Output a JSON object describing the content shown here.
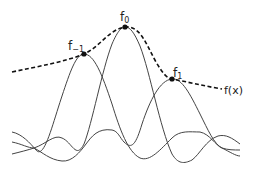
{
  "diagram": {
    "labels": {
      "f_minus1": {
        "base": "f",
        "sub": "−1"
      },
      "f_0": {
        "base": "f",
        "sub": "0"
      },
      "f_1": {
        "base": "f",
        "sub": "1"
      },
      "fx": "f(x)"
    },
    "samples": [
      {
        "name": "f_-1",
        "x": 84,
        "y": 54
      },
      {
        "name": "f_0",
        "x": 125,
        "y": 27
      },
      {
        "name": "f_1",
        "x": 172,
        "y": 79
      }
    ],
    "colors": {
      "curve": "#444444",
      "dashed": "#111111",
      "dot": "#111111"
    }
  }
}
